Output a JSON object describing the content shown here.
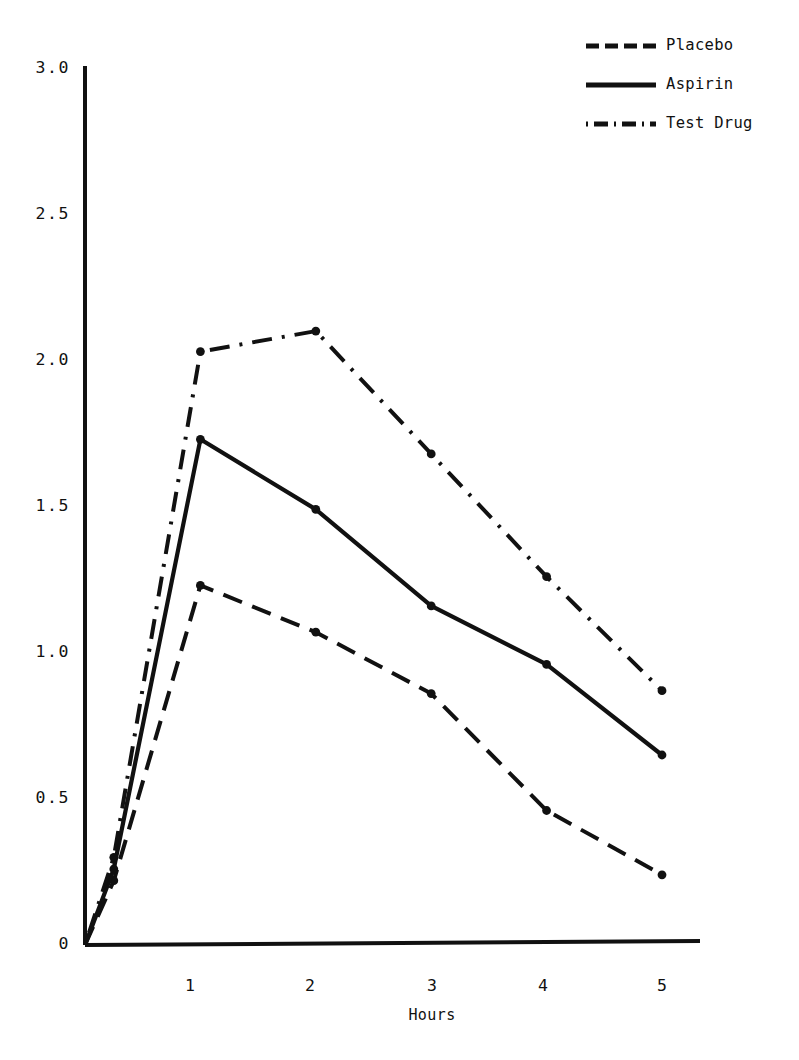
{
  "chart_data": {
    "type": "line",
    "title": "",
    "subtitle": "",
    "xlabel": "Hours",
    "ylabel": "",
    "xlim": [
      0,
      5.2
    ],
    "ylim": [
      0,
      3.0
    ],
    "grid": false,
    "legend_position": "top-right",
    "x_ticks": [
      "1",
      "2",
      "3",
      "4",
      "5"
    ],
    "x_tick_values": [
      1,
      2,
      3,
      4,
      5
    ],
    "y_ticks": [
      "0",
      "0.5",
      "1.0",
      "1.5",
      "2.0",
      "2.5",
      "3.0"
    ],
    "y_tick_values": [
      0,
      0.5,
      1.0,
      1.5,
      2.0,
      2.5,
      3.0
    ],
    "x": [
      0,
      0.25,
      1,
      2,
      3,
      4,
      5
    ],
    "series": [
      {
        "name": "Placebo",
        "style": "dashed",
        "color": "#111111",
        "values": [
          0,
          0.22,
          1.23,
          1.07,
          0.86,
          0.46,
          0.24
        ]
      },
      {
        "name": "Aspirin",
        "style": "solid",
        "color": "#111111",
        "values": [
          0,
          0.26,
          1.73,
          1.49,
          1.16,
          0.96,
          0.65
        ]
      },
      {
        "name": "Test Drug",
        "style": "dashdot",
        "color": "#111111",
        "values": [
          0,
          0.3,
          2.03,
          2.1,
          1.68,
          1.26,
          0.87
        ]
      }
    ]
  },
  "legend": {
    "items": [
      {
        "label": "Placebo",
        "style": "dashed"
      },
      {
        "label": "Aspirin",
        "style": "solid"
      },
      {
        "label": "Test Drug",
        "style": "dashdot"
      }
    ]
  },
  "axes": {
    "y_labels": [
      "3.0",
      "2.5",
      "2.0",
      "1.5",
      "1.0",
      "0.5",
      "0"
    ],
    "x_labels": [
      "1",
      "2",
      "3",
      "4",
      "5"
    ],
    "x_title": "Hours"
  }
}
